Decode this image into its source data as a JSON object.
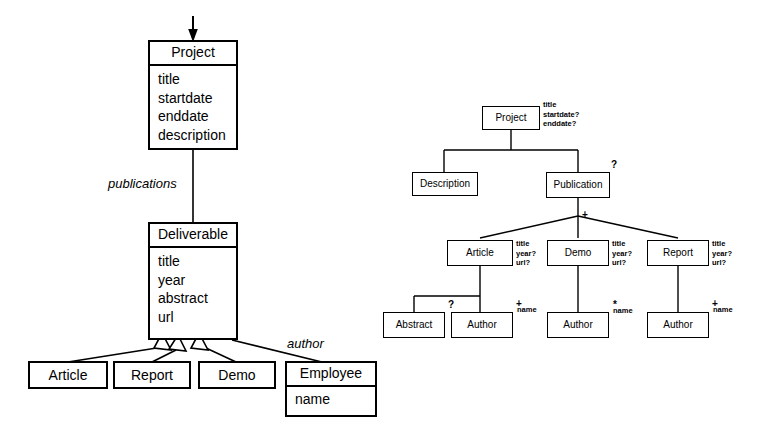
{
  "figure": {
    "kind": "schema-diagram",
    "ink_color": "#000000",
    "background_color": "#ffffff"
  },
  "uml_diagram": {
    "name": "uml-class-diagram",
    "root_arrow": "down-arrow",
    "classes": [
      {
        "id": "project",
        "name": "Project",
        "attributes": [
          "title",
          "startdate",
          "enddate",
          "description"
        ]
      },
      {
        "id": "deliverable",
        "name": "Deliverable",
        "attributes": [
          "title",
          "year",
          "abstract",
          "url"
        ]
      },
      {
        "id": "article",
        "name": "Article",
        "attributes": []
      },
      {
        "id": "report",
        "name": "Report",
        "attributes": []
      },
      {
        "id": "demo",
        "name": "Demo",
        "attributes": []
      },
      {
        "id": "employee",
        "name": "Employee",
        "attributes": [
          "name"
        ]
      }
    ],
    "associations": [
      {
        "from": "project",
        "to": "deliverable",
        "label": "publications",
        "style": "plain"
      },
      {
        "from": "deliverable",
        "to": "employee",
        "label": "author",
        "style": "plain"
      }
    ],
    "generalizations": [
      {
        "parent": "deliverable",
        "child": "article"
      },
      {
        "parent": "deliverable",
        "child": "report"
      },
      {
        "parent": "deliverable",
        "child": "demo"
      }
    ]
  },
  "dtd_tree": {
    "name": "dtd-schema-tree",
    "nodes": [
      {
        "id": "t-project",
        "label": "Project",
        "attributes": [
          "title",
          "startdate?",
          "enddate?"
        ],
        "cardinality": ""
      },
      {
        "id": "t-description",
        "label": "Description",
        "attributes": [],
        "cardinality": ""
      },
      {
        "id": "t-publication",
        "label": "Publication",
        "attributes": [],
        "cardinality": "?"
      },
      {
        "id": "t-article",
        "label": "Article",
        "attributes": [
          "title",
          "year?",
          "url?"
        ],
        "cardinality": ""
      },
      {
        "id": "t-demo",
        "label": "Demo",
        "attributes": [
          "title",
          "year?",
          "url?"
        ],
        "cardinality": ""
      },
      {
        "id": "t-report",
        "label": "Report",
        "attributes": [
          "title",
          "year?",
          "url?"
        ],
        "cardinality": ""
      },
      {
        "id": "t-abstract",
        "label": "Abstract",
        "attributes": [],
        "cardinality": "?"
      },
      {
        "id": "t-author-article",
        "label": "Author",
        "attributes": [
          "name"
        ],
        "cardinality": "+"
      },
      {
        "id": "t-author-demo",
        "label": "Author",
        "attributes": [
          "name"
        ],
        "cardinality": "*"
      },
      {
        "id": "t-author-report",
        "label": "Author",
        "attributes": [
          "name"
        ],
        "cardinality": "+"
      }
    ],
    "branch_markers": [
      {
        "id": "publication-children",
        "symbol": "+"
      }
    ]
  },
  "labels": {
    "uml": {
      "project_name": "Project",
      "project_attr_title": "title",
      "project_attr_startdate": "startdate",
      "project_attr_enddate": "enddate",
      "project_attr_description": "description",
      "deliverable_name": "Deliverable",
      "deliverable_attr_title": "title",
      "deliverable_attr_year": "year",
      "deliverable_attr_abstract": "abstract",
      "deliverable_attr_url": "url",
      "article_name": "Article",
      "report_name": "Report",
      "demo_name": "Demo",
      "employee_name": "Employee",
      "employee_attr_name": "name",
      "publications_label": "publications",
      "author_label": "author"
    },
    "tree": {
      "project": "Project",
      "project_attrs_line1": "title",
      "project_attrs_line2": "startdate?",
      "project_attrs_line3": "enddate?",
      "description": "Description",
      "publication": "Publication",
      "publication_card": "?",
      "publication_children_card": "+",
      "article": "Article",
      "article_attrs_line1": "title",
      "article_attrs_line2": "year?",
      "article_attrs_line3": "url?",
      "demo": "Demo",
      "demo_attrs_line1": "title",
      "demo_attrs_line2": "year?",
      "demo_attrs_line3": "url?",
      "report": "Report",
      "report_attrs_line1": "title",
      "report_attrs_line2": "year?",
      "report_attrs_line3": "url?",
      "abstract": "Abstract",
      "abstract_card": "?",
      "author_article": "Author",
      "author_article_card": "+",
      "author_article_attr": "name",
      "author_demo": "Author",
      "author_demo_card": "*",
      "author_demo_attr": "name",
      "author_report": "Author",
      "author_report_card": "+",
      "author_report_attr": "name"
    }
  }
}
